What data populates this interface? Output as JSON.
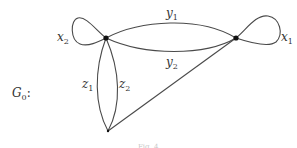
{
  "graph": {
    "name": "G",
    "name_subscript": "0",
    "name_suffix": ":",
    "vertices": [
      "left-top",
      "right-top",
      "bottom"
    ],
    "edges": [
      {
        "id": "x1",
        "label": "x",
        "subscript": "1",
        "type": "loop",
        "from": "right-top",
        "to": "right-top"
      },
      {
        "id": "x2",
        "label": "x",
        "subscript": "2",
        "type": "loop",
        "from": "left-top",
        "to": "left-top"
      },
      {
        "id": "y1",
        "label": "y",
        "subscript": "1",
        "type": "arc",
        "from": "left-top",
        "to": "right-top"
      },
      {
        "id": "y2",
        "label": "y",
        "subscript": "2",
        "type": "arc",
        "from": "left-top",
        "to": "right-top"
      },
      {
        "id": "z1",
        "label": "z",
        "subscript": "1",
        "type": "arc",
        "from": "left-top",
        "to": "bottom"
      },
      {
        "id": "z2",
        "label": "z",
        "subscript": "2",
        "type": "arc",
        "from": "left-top",
        "to": "bottom"
      },
      {
        "id": "w",
        "label": "",
        "subscript": "",
        "type": "line",
        "from": "bottom",
        "to": "right-top"
      }
    ]
  },
  "caption": "Fig. 4"
}
